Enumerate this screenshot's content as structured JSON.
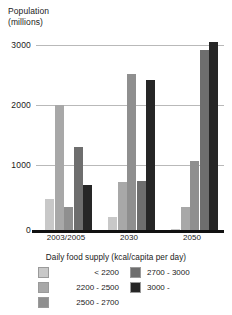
{
  "chart_data": {
    "type": "bar",
    "title": "",
    "ylabel": "Population\n(millions)",
    "xlabel": "",
    "categories": [
      "2003/2005",
      "2030",
      "2050"
    ],
    "ylim": [
      0,
      3200
    ],
    "yticks": [
      0,
      1000,
      2000,
      3000
    ],
    "ytick_labels": [
      "0",
      "1000",
      "2000",
      "3000"
    ],
    "grid": true,
    "legend_position": "bottom",
    "legend_title": "Daily food supply (kcal/capita per day)",
    "series": [
      {
        "name": "< 2200",
        "color": "#c8c8c8",
        "values": [
          520,
          210,
          10
        ]
      },
      {
        "name": "2200 - 2500",
        "color": "#a8a8a8",
        "values": [
          2080,
          800,
          390
        ]
      },
      {
        "name": "2500 - 2700",
        "color": "#8f8f8f",
        "values": [
          380,
          2600,
          1150
        ]
      },
      {
        "name": "2700 - 3000",
        "color": "#6e6e6e",
        "values": [
          1380,
          810,
          3000
        ]
      },
      {
        "name": "3000 -",
        "color": "#262626",
        "values": [
          750,
          2500,
          3130
        ]
      }
    ]
  },
  "axis": {
    "y_title_line1": "Population",
    "y_title_line2": "(millions)",
    "tick_3000": "3000",
    "tick_2000": "2000",
    "tick_1000": "1000",
    "tick_0": "0",
    "cat_1": "2003/2005",
    "cat_2": "2030",
    "cat_3": "2050"
  },
  "legend": {
    "title": "Daily food supply (kcal/capita per day)",
    "items": [
      {
        "label": "< 2200",
        "color": "#c8c8c8"
      },
      {
        "label": "2200 - 2500",
        "color": "#a8a8a8"
      },
      {
        "label": "2500 - 2700",
        "color": "#8f8f8f"
      },
      {
        "label": "2700 - 3000",
        "color": "#6e6e6e"
      },
      {
        "label": "3000 -",
        "color": "#262626"
      }
    ]
  }
}
